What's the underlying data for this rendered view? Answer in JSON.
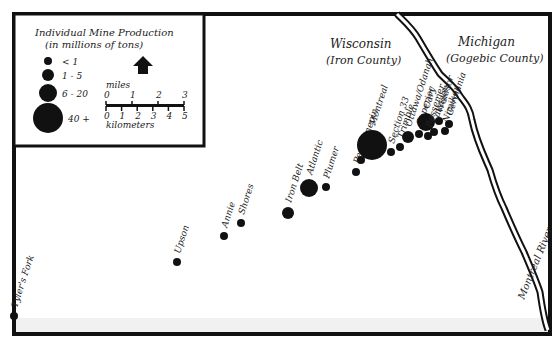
{
  "legend": {
    "title": "Individual Mine Production",
    "subtitle": "(in millions of tons)",
    "classes": [
      {
        "label": "< 1",
        "radius": 4
      },
      {
        "label": "1 - 5",
        "radius": 6
      },
      {
        "label": "6 - 20",
        "radius": 9
      },
      {
        "label": "40 +",
        "radius": 15
      }
    ],
    "north_arrow": "north-arrow",
    "scale": {
      "miles_label": "miles",
      "miles_ticks": [
        "0",
        "1",
        "2",
        "3"
      ],
      "km_label": "kilometers",
      "km_ticks": [
        "0",
        "1",
        "2",
        "3",
        "4",
        "5"
      ]
    }
  },
  "regions": {
    "wisconsin": {
      "name": "Wisconsin",
      "county": "(Iron County)"
    },
    "michigan": {
      "name": "Michigan",
      "county": "(Gogebic County)"
    }
  },
  "river": {
    "name": "Montreal River"
  },
  "mines": [
    {
      "name": "Tyler's Fork",
      "x": 14,
      "y": 316,
      "r": 4
    },
    {
      "name": "Upson",
      "x": 177,
      "y": 262,
      "r": 4
    },
    {
      "name": "Annie",
      "x": 224,
      "y": 236,
      "r": 4
    },
    {
      "name": "Shores",
      "x": 241,
      "y": 223,
      "r": 4
    },
    {
      "name": "Iron Belt",
      "x": 288,
      "y": 213,
      "r": 6
    },
    {
      "name": "Atlantic",
      "x": 309,
      "y": 188,
      "r": 9
    },
    {
      "name": "Plumer",
      "x": 326,
      "y": 187,
      "r": 4
    },
    {
      "name": "Pence",
      "x": 356,
      "y": 172,
      "r": 4
    },
    {
      "name": "Hennepin",
      "x": 361,
      "y": 160,
      "r": 4
    },
    {
      "name": "Montreal",
      "x": 372,
      "y": 145,
      "r": 15
    },
    {
      "name": "Section 33",
      "x": 391,
      "y": 152,
      "r": 4
    },
    {
      "name": "Trimble",
      "x": 400,
      "y": 147,
      "r": 4
    },
    {
      "name": "Ottawa/Odanah",
      "x": 408,
      "y": 137,
      "r": 6
    },
    {
      "name": "Superior",
      "x": 419,
      "y": 134,
      "r": 4
    },
    {
      "name": "Cary",
      "x": 426,
      "y": 122,
      "r": 9
    },
    {
      "name": "Bessemer",
      "x": 428,
      "y": 136,
      "r": 4
    },
    {
      "name": "Kakagon",
      "x": 434,
      "y": 132,
      "r": 4
    },
    {
      "name": "Windsor",
      "x": 439,
      "y": 121,
      "r": 4
    },
    {
      "name": "Nimikon",
      "x": 445,
      "y": 131,
      "r": 4
    },
    {
      "name": "Germania",
      "x": 449,
      "y": 124,
      "r": 4
    }
  ]
}
